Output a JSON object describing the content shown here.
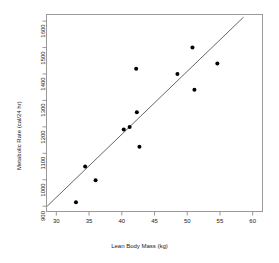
{
  "chart_data": {
    "type": "scatter",
    "title": "",
    "xlabel": "Lean Body Mass (kg)",
    "ylabel": "Metabolic Rate (cal/24 hr)",
    "xlim": [
      28.5,
      61.5
    ],
    "ylim": [
      880,
      1625
    ],
    "xticks": [
      30,
      35,
      40,
      45,
      50,
      55,
      60
    ],
    "yticks": [
      900,
      1000,
      1100,
      1200,
      1300,
      1400,
      1500,
      1600
    ],
    "xtick_labels": [
      "30",
      "35",
      "40",
      "45",
      "50",
      "55",
      "60"
    ],
    "ytick_labels": [
      "900",
      "1000",
      "1100",
      "1200",
      "1300",
      "1400",
      "1500",
      "1600"
    ],
    "grid": false,
    "legend": null,
    "point_color": "#000000",
    "line_color": "#555555",
    "frame_color": "#999999",
    "x": [
      33.0,
      34.4,
      36.0,
      40.3,
      41.2,
      42.2,
      42.3,
      42.7,
      48.5,
      50.8,
      51.1,
      54.6
    ],
    "y": [
      915,
      1050,
      998,
      1190,
      1200,
      1420,
      1255,
      1125,
      1400,
      1500,
      1340,
      1440
    ],
    "series": [
      {
        "name": "observations",
        "points": [
          {
            "x": 33.0,
            "y": 915
          },
          {
            "x": 34.4,
            "y": 1050
          },
          {
            "x": 36.0,
            "y": 998
          },
          {
            "x": 40.3,
            "y": 1190
          },
          {
            "x": 41.2,
            "y": 1200
          },
          {
            "x": 42.2,
            "y": 1420
          },
          {
            "x": 42.3,
            "y": 1255
          },
          {
            "x": 42.7,
            "y": 1125
          },
          {
            "x": 48.5,
            "y": 1400
          },
          {
            "x": 50.8,
            "y": 1500
          },
          {
            "x": 51.1,
            "y": 1340
          },
          {
            "x": 54.6,
            "y": 1440
          }
        ]
      }
    ],
    "fit_line": {
      "name": "regression-line",
      "x_start": 28.6,
      "y_start": 900,
      "x_end": 58.6,
      "y_end": 1615
    }
  }
}
